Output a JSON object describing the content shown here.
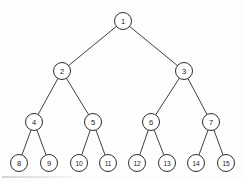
{
  "figure": {
    "background_color": "#fdfdfd",
    "node_stroke_color": "#2f2f2f",
    "node_fill_color": "#ffffff",
    "edge_color": "#2b2b2b",
    "label_color": "#1a1a1a",
    "width": 244,
    "height": 181
  },
  "nodes": [
    {
      "id": 1,
      "label": "1",
      "x": 123,
      "y": 21,
      "r": 8.5,
      "level": 0
    },
    {
      "id": 2,
      "label": "2",
      "x": 62,
      "y": 71,
      "r": 8.5,
      "level": 1
    },
    {
      "id": 3,
      "label": "3",
      "x": 184,
      "y": 71,
      "r": 8.5,
      "level": 1
    },
    {
      "id": 4,
      "label": "4",
      "x": 34,
      "y": 122,
      "r": 8.5,
      "level": 2
    },
    {
      "id": 5,
      "label": "5",
      "x": 93,
      "y": 122,
      "r": 8.5,
      "level": 2
    },
    {
      "id": 6,
      "label": "6",
      "x": 151,
      "y": 122,
      "r": 8.5,
      "level": 2
    },
    {
      "id": 7,
      "label": "7",
      "x": 211,
      "y": 122,
      "r": 8.5,
      "level": 2
    },
    {
      "id": 8,
      "label": "8",
      "x": 19,
      "y": 163,
      "r": 8.5,
      "level": 3
    },
    {
      "id": 9,
      "label": "9",
      "x": 49,
      "y": 163,
      "r": 8.5,
      "level": 3
    },
    {
      "id": 10,
      "label": "10",
      "x": 79,
      "y": 163,
      "r": 8.5,
      "level": 3
    },
    {
      "id": 11,
      "label": "11",
      "x": 108,
      "y": 163,
      "r": 8.5,
      "level": 3
    },
    {
      "id": 12,
      "label": "12",
      "x": 137,
      "y": 163,
      "r": 8.5,
      "level": 3
    },
    {
      "id": 13,
      "label": "13",
      "x": 167,
      "y": 163,
      "r": 8.5,
      "level": 3
    },
    {
      "id": 14,
      "label": "14",
      "x": 196,
      "y": 163,
      "r": 8.5,
      "level": 3
    },
    {
      "id": 15,
      "label": "15",
      "x": 226,
      "y": 163,
      "r": 8.5,
      "level": 3
    }
  ],
  "edges": [
    {
      "from": 1,
      "to": 2
    },
    {
      "from": 1,
      "to": 3
    },
    {
      "from": 2,
      "to": 4
    },
    {
      "from": 2,
      "to": 5
    },
    {
      "from": 3,
      "to": 6
    },
    {
      "from": 3,
      "to": 7
    },
    {
      "from": 4,
      "to": 8
    },
    {
      "from": 4,
      "to": 9
    },
    {
      "from": 5,
      "to": 10
    },
    {
      "from": 5,
      "to": 11
    },
    {
      "from": 6,
      "to": 12
    },
    {
      "from": 6,
      "to": 13
    },
    {
      "from": 7,
      "to": 14
    },
    {
      "from": 7,
      "to": 15
    }
  ]
}
